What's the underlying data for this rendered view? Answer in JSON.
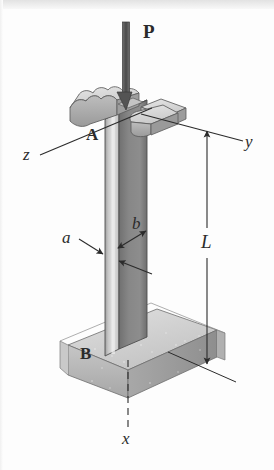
{
  "figure": {
    "type": "engineering-diagram",
    "background_color": "#fdfdfd",
    "ink_color": "#2b2b2b"
  },
  "labels": {
    "load": "P",
    "top_point": "A",
    "base_point": "B",
    "length": "L",
    "width_a": "a",
    "width_b": "b",
    "axis_x": "x",
    "axis_y": "y",
    "axis_z": "z"
  },
  "geometry": {
    "column": {
      "top_y": 115,
      "bottom_y": 356,
      "front_face_left_x": 105,
      "front_face_right_x": 119,
      "side_face_right_x": 147,
      "front_face_color": "#b9b9b9",
      "side_face_color": "#7e7e7e",
      "highlight_color": "#dcdcdc"
    },
    "base_block": {
      "top_face_color": "#d2d2d2",
      "front_face_color": "#b4b4b4",
      "right_face_color": "#9e9e9e"
    },
    "cap_plates": {
      "count": 3,
      "top_face_color": "#d6d6d6",
      "front_face_color": "#a8a8a8"
    },
    "load_arrow": {
      "x": 127,
      "top_y": 22,
      "tip_y": 110
    },
    "dimension_L": {
      "x": 207,
      "top_y": 128,
      "bottom_y": 367
    }
  },
  "colors": {
    "stroke": "#2b2b2b",
    "arrow_fill": "#555555",
    "light_gray": "#dcdcdc",
    "mid_gray": "#b9b9b9",
    "dark_gray": "#7e7e7e"
  }
}
